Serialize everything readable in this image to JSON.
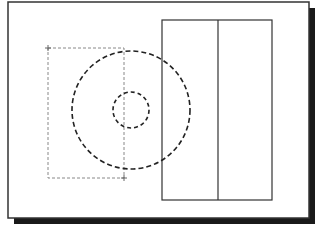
{
  "canvas": {
    "width": 319,
    "height": 228,
    "background": "#ffffff"
  },
  "frame": {
    "x": 8,
    "y": 2,
    "width": 301,
    "height": 216,
    "stroke": "#333333",
    "stroke_width": 1.5,
    "fill": "#ffffff",
    "shadow": {
      "offset": 6,
      "color": "#1a1a1a"
    }
  },
  "selection_box": {
    "x": 48,
    "y": 48,
    "width": 76,
    "height": 130,
    "stroke": "#888888",
    "dash": "3,2",
    "handles": [
      {
        "x": 48,
        "y": 48
      },
      {
        "x": 124,
        "y": 178
      }
    ]
  },
  "circles": [
    {
      "name": "outer-circle",
      "cx": 131,
      "cy": 110,
      "r": 59,
      "stroke": "#222222",
      "stroke_width": 1.6,
      "dash": "5,3"
    },
    {
      "name": "inner-circle",
      "cx": 131,
      "cy": 110,
      "r": 18,
      "stroke": "#222222",
      "stroke_width": 1.6,
      "dash": "4,3"
    }
  ],
  "panel_rect": {
    "x": 162,
    "y": 20,
    "width": 110,
    "height": 180,
    "stroke": "#333333",
    "stroke_width": 1.2,
    "divider_x": 218
  }
}
